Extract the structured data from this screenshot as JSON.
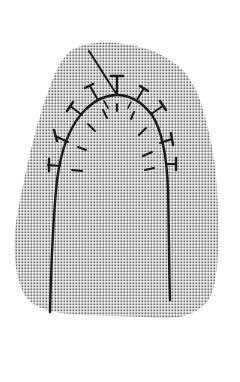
{
  "figure": {
    "description": "Line illustration of an arch-shaped suture line with interrupted stitches over a stippled tissue region",
    "colors": {
      "background": "#ffffff",
      "stipple": "#6e6e6e",
      "ink": "#1a1a1a"
    },
    "tissue_region": {
      "label": "stippled tissue"
    },
    "suture_line": {
      "label": "arch incision line"
    },
    "needle_line": {
      "label": "suture thread"
    },
    "stitches": {
      "count": 11
    }
  }
}
